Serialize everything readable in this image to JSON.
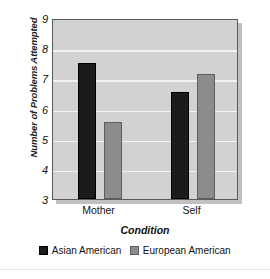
{
  "chart_data": {
    "type": "bar",
    "title": "",
    "subtitle": "",
    "xlabel": "Condition",
    "ylabel": "Number of Problems Attempted",
    "categories": [
      "Mother",
      "Self"
    ],
    "series": [
      {
        "name": "Asian American",
        "color": "#1b1b1b",
        "values": [
          7.5,
          6.55
        ]
      },
      {
        "name": "European American",
        "color": "#8c8c8c",
        "values": [
          5.55,
          7.15
        ]
      }
    ],
    "ylim": [
      3,
      9
    ],
    "yticks": [
      9,
      8,
      7,
      6,
      5,
      4,
      3
    ],
    "ytick_labels": [
      "9",
      "8",
      "7",
      "6",
      "5",
      "4",
      "3"
    ],
    "grid": true,
    "grid_color": "#f2f2f2",
    "plot_bg": "#d2d2d2",
    "legend_position": "bottom",
    "legend_entries": [
      "Asian American",
      "European American"
    ]
  }
}
